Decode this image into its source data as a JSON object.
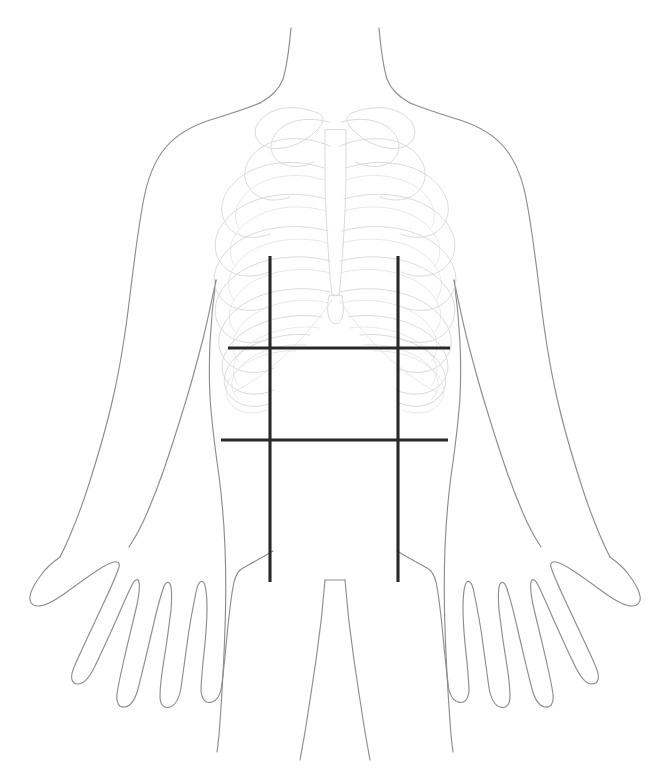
{
  "diagram": {
    "background_color": "#ffffff",
    "body_outline_color": "#8d8d91",
    "ribcage_color": "#d8d8dd",
    "grid_color": "#282828",
    "canvas": {
      "width": 671,
      "height": 769
    }
  },
  "figure": {
    "view": "anterior",
    "parts": [
      {
        "name": "head-neck",
        "label": "Neck"
      },
      {
        "name": "left-shoulder",
        "label": "Right shoulder (viewer left)"
      },
      {
        "name": "right-shoulder",
        "label": "Left shoulder (viewer right)"
      },
      {
        "name": "left-arm",
        "label": "Right arm (viewer left)"
      },
      {
        "name": "right-arm",
        "label": "Left arm (viewer right)"
      },
      {
        "name": "left-hand",
        "label": "Right hand (viewer left)"
      },
      {
        "name": "right-hand",
        "label": "Left hand (viewer right)"
      },
      {
        "name": "torso",
        "label": "Torso"
      },
      {
        "name": "legs",
        "label": "Legs"
      }
    ]
  },
  "skeleton": {
    "name": "rib-cage",
    "label": "Rib cage",
    "visible": true,
    "stroke": "#d8d8dd",
    "components": [
      {
        "name": "clavicle-left",
        "label": "Clavicle (viewer left)"
      },
      {
        "name": "clavicle-right",
        "label": "Clavicle (viewer right)"
      },
      {
        "name": "sternum",
        "label": "Sternum"
      },
      {
        "name": "xiphoid-process",
        "label": "Xiphoid process"
      },
      {
        "name": "ribs-left",
        "label": "Ribs (viewer left)",
        "count": 10
      },
      {
        "name": "ribs-right",
        "label": "Ribs (viewer right)",
        "count": 10
      }
    ]
  },
  "grid": {
    "name": "nine-region-grid",
    "label": "Abdominal nine-region grid",
    "stroke": "#282828",
    "stroke_width": 3,
    "vertical_lines": [
      {
        "name": "left-midclavicular-line",
        "label": "Left midclavicular line",
        "x": 270,
        "y1": 256,
        "y2": 582
      },
      {
        "name": "right-midclavicular-line",
        "label": "Right midclavicular line",
        "x": 398,
        "y1": 256,
        "y2": 582
      }
    ],
    "horizontal_lines": [
      {
        "name": "subcostal-plane",
        "label": "Subcostal plane",
        "y": 348,
        "x1": 228,
        "x2": 450
      },
      {
        "name": "transtubercular-plane",
        "label": "Transtubercular plane",
        "y": 440,
        "x1": 221,
        "x2": 448
      }
    ],
    "regions": [
      {
        "name": "region-right-hypochondriac",
        "label": "Right hypochondriac"
      },
      {
        "name": "region-epigastric",
        "label": "Epigastric"
      },
      {
        "name": "region-left-hypochondriac",
        "label": "Left hypochondriac"
      },
      {
        "name": "region-right-lumbar",
        "label": "Right lumbar"
      },
      {
        "name": "region-umbilical",
        "label": "Umbilical"
      },
      {
        "name": "region-left-lumbar",
        "label": "Left lumbar"
      },
      {
        "name": "region-right-iliac",
        "label": "Right iliac"
      },
      {
        "name": "region-hypogastric",
        "label": "Hypogastric"
      },
      {
        "name": "region-left-iliac",
        "label": "Left iliac"
      }
    ]
  }
}
